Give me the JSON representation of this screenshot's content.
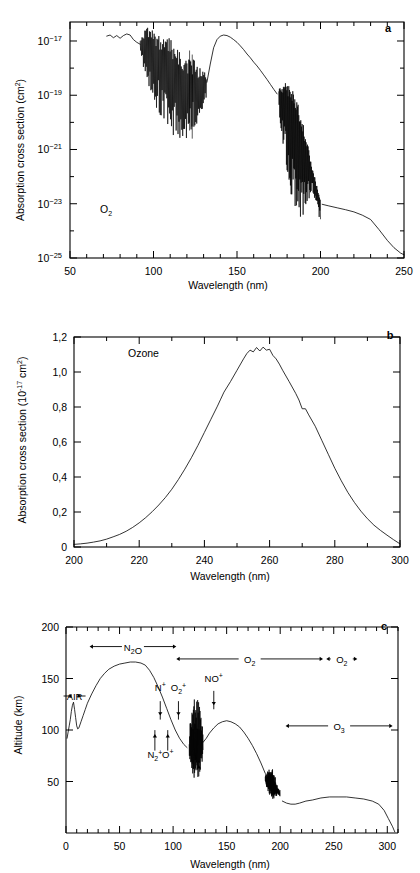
{
  "figure": {
    "kind": "three-panel-scientific-figure",
    "panels": [
      "a",
      "b",
      "c"
    ]
  },
  "chart_data": [
    {
      "panel_label": "a",
      "type": "line",
      "title": "",
      "species_label": "O2",
      "xlabel": "Wavelength (nm)",
      "ylabel": "Absorption cross section (cm2)",
      "ylabel_parts": {
        "main": "Absorption cross section (cm",
        "sup": "2",
        "tail": ")"
      },
      "xlim": [
        50,
        250
      ],
      "ylim_log": [
        -25,
        -16.3
      ],
      "yscale": "log",
      "xticks_major": [
        50,
        100,
        150,
        200,
        250
      ],
      "xticks_minor_step": 10,
      "yticks_major_exp": [
        -25,
        -23,
        -21,
        -19,
        -17
      ],
      "yticklabels": [
        "10-25",
        "10-23",
        "10-21",
        "10-19",
        "10-17"
      ],
      "grid": false,
      "legend": "none",
      "comment": "O2 absorption cross section vs wavelength; continuum plus Schumann-Runge band structure",
      "smooth_points": [
        [
          72.0,
          -16.82
        ],
        [
          74.0,
          -16.78
        ],
        [
          76.0,
          -16.88
        ],
        [
          78.0,
          -16.8
        ],
        [
          80.0,
          -16.9
        ],
        [
          82.0,
          -16.8
        ],
        [
          84.0,
          -16.74
        ],
        [
          86.0,
          -16.78
        ],
        [
          88.0,
          -16.95
        ],
        [
          90.0,
          -17.05
        ],
        [
          92.0,
          -17.12
        ],
        [
          94.0,
          -17.2
        ],
        [
          96.0,
          -17.18
        ],
        [
          98.0,
          -17.32
        ],
        [
          100.0,
          -17.45
        ],
        [
          102.0,
          -17.62
        ],
        [
          104.0,
          -17.8
        ],
        [
          106.0,
          -17.95
        ],
        [
          108.0,
          -18.05
        ],
        [
          110.0,
          -18.15
        ],
        [
          112.0,
          -18.3
        ],
        [
          114.0,
          -18.42
        ],
        [
          116.0,
          -18.55
        ],
        [
          118.0,
          -18.6
        ],
        [
          120.0,
          -18.62
        ],
        [
          122.0,
          -18.66
        ],
        [
          124.0,
          -18.58
        ],
        [
          126.0,
          -18.64
        ],
        [
          128.0,
          -18.7
        ],
        [
          130.0,
          -18.6
        ],
        [
          132.0,
          -18.52
        ],
        [
          134.0,
          -17.85
        ],
        [
          136.0,
          -17.25
        ],
        [
          138.0,
          -16.95
        ],
        [
          140.0,
          -16.82
        ],
        [
          142.0,
          -16.78
        ],
        [
          144.0,
          -16.8
        ],
        [
          146.0,
          -16.86
        ],
        [
          148.0,
          -16.95
        ],
        [
          150.0,
          -17.05
        ],
        [
          152.0,
          -17.18
        ],
        [
          154.0,
          -17.32
        ],
        [
          156.0,
          -17.48
        ],
        [
          158.0,
          -17.62
        ],
        [
          160.0,
          -17.78
        ],
        [
          162.0,
          -17.92
        ],
        [
          164.0,
          -18.08
        ],
        [
          166.0,
          -18.25
        ],
        [
          168.0,
          -18.42
        ],
        [
          170.0,
          -18.6
        ],
        [
          172.0,
          -18.78
        ],
        [
          174.0,
          -18.95
        ],
        [
          176.0,
          -19.05
        ],
        [
          178.0,
          -19.2
        ],
        [
          180.0,
          -19.45
        ],
        [
          182.0,
          -19.75
        ],
        [
          184.0,
          -20.05
        ],
        [
          186.0,
          -20.35
        ],
        [
          188.0,
          -20.65
        ],
        [
          190.0,
          -20.95
        ],
        [
          192.0,
          -21.3
        ],
        [
          194.0,
          -21.7
        ],
        [
          196.0,
          -22.1
        ],
        [
          198.0,
          -22.6
        ],
        [
          199.5,
          -22.95
        ],
        [
          201.0,
          -23.02
        ],
        [
          205.0,
          -23.08
        ],
        [
          210.0,
          -23.15
        ],
        [
          215.0,
          -23.22
        ],
        [
          220.0,
          -23.3
        ],
        [
          225.0,
          -23.42
        ],
        [
          230.0,
          -23.58
        ],
        [
          235.0,
          -23.95
        ],
        [
          240.0,
          -24.35
        ],
        [
          244.0,
          -24.62
        ],
        [
          248.0,
          -24.82
        ],
        [
          250.0,
          -24.88
        ]
      ],
      "band_region_1": {
        "x_start": 92,
        "x_end": 132,
        "note": "dense line structure, Lyman/ionization continuum region"
      },
      "band_region_2": {
        "x_start": 175,
        "x_end": 200,
        "note": "Schumann-Runge bands, dense vertical line structure"
      }
    },
    {
      "panel_label": "b",
      "type": "line",
      "title": "",
      "species_label": "Ozone",
      "xlabel": "Wavelength (nm)",
      "ylabel": "Absorption cross section (10-17 cm2)",
      "ylabel_parts": {
        "main": "Absorption cross section (10",
        "sup": "-17",
        "mid": " cm",
        "sup2": "2",
        "tail": ")"
      },
      "xlim": [
        200,
        300
      ],
      "ylim": [
        0,
        1.2
      ],
      "yscale": "linear",
      "xticks_major": [
        200,
        220,
        240,
        260,
        280,
        300
      ],
      "xticks_minor_step": 10,
      "yticks_major": [
        0,
        0.2,
        0.4,
        0.6,
        0.8,
        1.0,
        1.2
      ],
      "yticklabels": [
        "0",
        "0,2",
        "0,4",
        "0,6",
        "0,8",
        "1,0",
        "1,2"
      ],
      "decimal_separator": ",",
      "grid": false,
      "legend": "none",
      "comment": "Ozone Hartley band absorption cross section, peak near 255 nm",
      "points": [
        [
          200,
          0.015
        ],
        [
          202,
          0.018
        ],
        [
          204,
          0.022
        ],
        [
          206,
          0.028
        ],
        [
          208,
          0.035
        ],
        [
          210,
          0.045
        ],
        [
          212,
          0.058
        ],
        [
          214,
          0.072
        ],
        [
          216,
          0.09
        ],
        [
          218,
          0.112
        ],
        [
          220,
          0.138
        ],
        [
          222,
          0.168
        ],
        [
          224,
          0.202
        ],
        [
          226,
          0.24
        ],
        [
          228,
          0.282
        ],
        [
          230,
          0.33
        ],
        [
          232,
          0.385
        ],
        [
          234,
          0.445
        ],
        [
          236,
          0.51
        ],
        [
          238,
          0.58
        ],
        [
          240,
          0.655
        ],
        [
          242,
          0.73
        ],
        [
          244,
          0.805
        ],
        [
          245,
          0.845
        ],
        [
          246,
          0.885
        ],
        [
          248,
          0.945
        ],
        [
          250,
          1.01
        ],
        [
          252,
          1.075
        ],
        [
          253,
          1.105
        ],
        [
          254,
          1.125
        ],
        [
          255,
          1.115
        ],
        [
          256,
          1.14
        ],
        [
          257,
          1.12
        ],
        [
          258,
          1.142
        ],
        [
          259,
          1.125
        ],
        [
          260,
          1.13
        ],
        [
          261,
          1.095
        ],
        [
          262,
          1.075
        ],
        [
          263,
          1.045
        ],
        [
          264,
          1.01
        ],
        [
          266,
          0.945
        ],
        [
          268,
          0.878
        ],
        [
          269,
          0.84
        ],
        [
          270,
          0.79
        ],
        [
          271,
          0.79
        ],
        [
          272,
          0.755
        ],
        [
          274,
          0.69
        ],
        [
          276,
          0.61
        ],
        [
          278,
          0.53
        ],
        [
          280,
          0.45
        ],
        [
          282,
          0.378
        ],
        [
          284,
          0.312
        ],
        [
          286,
          0.255
        ],
        [
          288,
          0.205
        ],
        [
          290,
          0.162
        ],
        [
          292,
          0.125
        ],
        [
          294,
          0.095
        ],
        [
          296,
          0.068
        ],
        [
          298,
          0.042
        ],
        [
          300,
          0.018
        ]
      ]
    },
    {
      "panel_label": "c",
      "type": "line",
      "title": "",
      "xlabel": "Wavelength (nm)",
      "ylabel": "Altitude (km)",
      "xlim": [
        0,
        310
      ],
      "ylim": [
        0,
        200
      ],
      "yscale": "linear",
      "xticks_major": [
        0,
        50,
        100,
        150,
        200,
        250,
        300
      ],
      "xticks_minor_step": 10,
      "yticks_major": [
        50,
        100,
        150,
        200
      ],
      "yticklabels": [
        "50",
        "100",
        "150",
        "200"
      ],
      "grid": false,
      "legend": "none",
      "comment": "Penetration depth (unit optical depth altitude) of solar radiation vs wavelength",
      "points": [
        [
          1,
          92
        ],
        [
          2,
          98
        ],
        [
          3,
          104
        ],
        [
          4,
          110
        ],
        [
          5,
          118
        ],
        [
          6,
          124
        ],
        [
          7,
          127
        ],
        [
          8,
          120
        ],
        [
          9,
          112
        ],
        [
          10,
          104
        ],
        [
          11,
          101
        ],
        [
          12,
          102
        ],
        [
          14,
          108
        ],
        [
          16,
          114
        ],
        [
          18,
          120
        ],
        [
          20,
          126
        ],
        [
          24,
          135
        ],
        [
          28,
          143
        ],
        [
          32,
          150
        ],
        [
          36,
          155
        ],
        [
          40,
          159
        ],
        [
          45,
          162
        ],
        [
          50,
          164
        ],
        [
          55,
          165
        ],
        [
          60,
          166
        ],
        [
          65,
          166
        ],
        [
          70,
          165
        ],
        [
          74,
          163
        ],
        [
          78,
          158
        ],
        [
          82,
          151
        ],
        [
          86,
          142
        ],
        [
          90,
          132
        ],
        [
          94,
          121
        ],
        [
          98,
          110
        ],
        [
          102,
          100
        ],
        [
          106,
          92
        ],
        [
          110,
          86
        ],
        [
          113,
          83
        ],
        [
          116,
          82
        ],
        [
          118,
          83
        ],
        [
          120,
          84
        ],
        [
          124,
          85
        ],
        [
          128,
          88
        ],
        [
          131,
          92
        ],
        [
          134,
          97
        ],
        [
          138,
          102
        ],
        [
          142,
          106
        ],
        [
          146,
          108
        ],
        [
          150,
          109
        ],
        [
          154,
          108
        ],
        [
          158,
          106
        ],
        [
          162,
          103
        ],
        [
          166,
          98
        ],
        [
          170,
          92
        ],
        [
          174,
          85
        ],
        [
          178,
          77
        ],
        [
          182,
          68
        ],
        [
          186,
          58
        ],
        [
          190,
          49
        ],
        [
          194,
          42
        ],
        [
          198,
          36
        ],
        [
          202,
          31
        ],
        [
          206,
          29
        ],
        [
          210,
          28
        ],
        [
          214,
          28
        ],
        [
          218,
          29
        ],
        [
          224,
          31
        ],
        [
          230,
          32
        ],
        [
          238,
          34
        ],
        [
          246,
          35
        ],
        [
          254,
          35
        ],
        [
          262,
          35
        ],
        [
          270,
          34
        ],
        [
          278,
          33
        ],
        [
          286,
          31
        ],
        [
          292,
          28
        ],
        [
          297,
          22
        ],
        [
          301,
          14
        ],
        [
          305,
          6
        ],
        [
          307,
          1
        ]
      ],
      "spike_region_1": {
        "x_start": 115,
        "x_end": 128,
        "y_low": 60,
        "y_high": 125,
        "note": "sharp Lyman-alpha / line structure"
      },
      "spike_region_2": {
        "x_start": 186,
        "x_end": 200,
        "y_low": 40,
        "y_high": 65,
        "note": "Schumann-Runge band structure"
      },
      "range_annotations": [
        {
          "label": "AIR",
          "x_start": 2,
          "x_end": 14,
          "y": 133,
          "style": "double-arrow-inline"
        },
        {
          "label": "N2O",
          "x_start": 22,
          "x_end": 103,
          "y": 181,
          "style": "double-arrow-span"
        },
        {
          "label": "O2",
          "x_start": 103,
          "x_end": 240,
          "y": 169,
          "style": "double-arrow-span"
        },
        {
          "label": "O2",
          "x_start": 243,
          "x_end": 272,
          "y": 169,
          "style": "double-arrow-span"
        },
        {
          "label": "O3",
          "x_start": 205,
          "x_end": 305,
          "y": 104,
          "style": "double-arrow-span"
        }
      ],
      "ion_annotations": [
        {
          "label": "N+",
          "x": 88,
          "y_label": 138,
          "arrow": "down",
          "arrow_from": 128,
          "arrow_to": 114
        },
        {
          "label": "O2+",
          "x": 105,
          "y_label": 138,
          "arrow": "down",
          "arrow_from": 128,
          "arrow_to": 114
        },
        {
          "label": "NO+",
          "x": 138,
          "y_label": 147,
          "arrow": "down",
          "arrow_from": 138,
          "arrow_to": 124
        },
        {
          "label": "N2+",
          "x": 83,
          "y_label": 73,
          "arrow": "up",
          "arrow_from": 80,
          "arrow_to": 96
        },
        {
          "label": "O+",
          "x": 95,
          "y_label": 73,
          "arrow": "up",
          "arrow_from": 80,
          "arrow_to": 96
        },
        {
          "label": "",
          "x": 124,
          "y_label": 0,
          "arrow": "up",
          "arrow_from": 55,
          "arrow_to": 66
        }
      ]
    }
  ]
}
